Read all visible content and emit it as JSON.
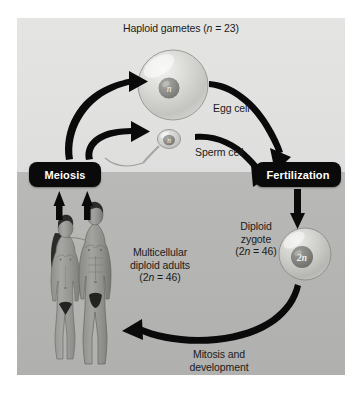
{
  "diagram": {
    "background": {
      "upper_band_color": "#e1e1df",
      "lower_band_color": "#b4b4b2",
      "page_color": "#ffffff"
    },
    "labels": {
      "haploid_gametes": "Haploid gametes (n = 23)",
      "haploid_gametes_prefix": "Haploid gametes (",
      "haploid_gametes_italic": "n",
      "haploid_gametes_suffix": " = 23)",
      "egg_cell": "Egg cell",
      "sperm_cell": "Sperm cell",
      "diploid_zygote_line1": "Diploid",
      "diploid_zygote_line2": "zygote",
      "diploid_zygote_line3_prefix": "(2",
      "diploid_zygote_line3_italic": "n",
      "diploid_zygote_line3_suffix": " = 46)",
      "adults_line1": "Multicellular",
      "adults_line2": "diploid adults",
      "adults_line3_prefix": "(2",
      "adults_line3_italic": "n",
      "adults_line3_suffix": " = 46)",
      "mitosis_line1": "Mitosis and",
      "mitosis_line2": "development"
    },
    "processes": [
      {
        "id": "meiosis",
        "label": "Meiosis",
        "box_color": "#0a0a0a",
        "text_color": "#ffffff"
      },
      {
        "id": "fertilization",
        "label": "Fertilization",
        "box_color": "#0a0a0a",
        "text_color": "#ffffff"
      }
    ],
    "cells": [
      {
        "id": "egg-cell",
        "nucleus_label": "n",
        "ploidy": "haploid",
        "chromosome_count": 23
      },
      {
        "id": "sperm-cell",
        "nucleus_label": "n",
        "ploidy": "haploid",
        "chromosome_count": 23
      },
      {
        "id": "zygote-cell",
        "nucleus_label": "2n",
        "ploidy": "diploid",
        "chromosome_count": 46
      }
    ],
    "organisms": [
      {
        "id": "adult-female",
        "description": "female human figure"
      },
      {
        "id": "adult-male",
        "description": "male human figure"
      }
    ],
    "arrows": [
      {
        "id": "meiosis-to-egg",
        "from": "meiosis",
        "to": "egg-cell"
      },
      {
        "id": "meiosis-to-sperm",
        "from": "meiosis",
        "to": "sperm-cell"
      },
      {
        "id": "egg-to-fertilization",
        "from": "egg-cell",
        "to": "fertilization"
      },
      {
        "id": "sperm-to-fertilization",
        "from": "sperm-cell",
        "to": "fertilization"
      },
      {
        "id": "fertilization-to-zygote",
        "from": "fertilization",
        "to": "zygote-cell"
      },
      {
        "id": "zygote-to-adults",
        "from": "zygote-cell",
        "to": "adults"
      },
      {
        "id": "adult-female-to-meiosis",
        "from": "adult-female",
        "to": "meiosis"
      },
      {
        "id": "adult-male-to-meiosis",
        "from": "adult-male",
        "to": "meiosis"
      }
    ],
    "arrow_color": "#0a0a0a"
  }
}
